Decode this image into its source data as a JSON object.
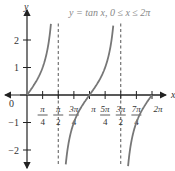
{
  "chart_data": {
    "type": "line",
    "title": "y = tan x, 0 ≤ x ≤ 2π",
    "xlabel": "x",
    "ylabel": "y",
    "xlim": [
      0,
      6.2832
    ],
    "ylim": [
      -2.6,
      2.6
    ],
    "x_ticks": [
      {
        "num": "π",
        "den": "4",
        "value": 0.7854
      },
      {
        "num": "π",
        "den": "2",
        "value": 1.5708
      },
      {
        "num": "3π",
        "den": "4",
        "value": 2.3562
      },
      {
        "num": "π",
        "den": "",
        "value": 3.1416
      },
      {
        "num": "5π",
        "den": "4",
        "value": 3.927
      },
      {
        "num": "3π",
        "den": "2",
        "value": 4.7124
      },
      {
        "num": "7π",
        "den": "4",
        "value": 5.4978
      },
      {
        "num": "2π",
        "den": "",
        "value": 6.2832
      }
    ],
    "y_ticks": [
      2,
      1,
      -1,
      -2
    ],
    "y_tick_labels": [
      "2",
      "1",
      "−1",
      "−2"
    ],
    "origin_label": "0",
    "asymptotes": [
      1.5708,
      4.7124
    ],
    "series": [
      {
        "name": "tan x",
        "function": "tan(x)",
        "domain": [
          0,
          6.2832
        ],
        "color": "#777777"
      }
    ],
    "grid": false,
    "legend": null
  }
}
